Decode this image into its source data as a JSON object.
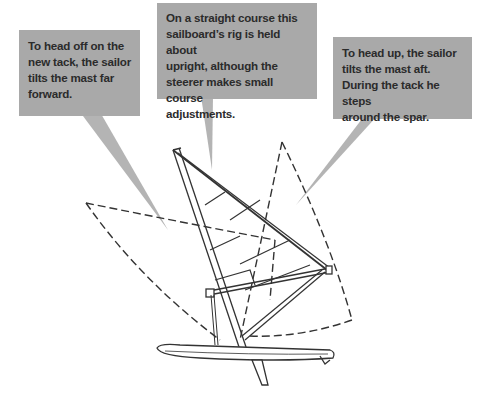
{
  "diagram": {
    "callouts": {
      "left": {
        "text": "To head off on the new tack, the sailor tilts the mast far forward.",
        "lines": [
          "To head off on the",
          "new tack, the sailor",
          "tilts the mast far",
          "forward."
        ]
      },
      "middle": {
        "text": "On a straight course this sailboard's rig is held about upright, although the steerer makes small course adjustments.",
        "lines": [
          "On a straight course this",
          "sailboard’s rig is held about",
          "upright, although the",
          "steerer makes small course",
          "adjustments."
        ]
      },
      "right": {
        "text": "To head up, the sailor tilts the mast aft. During the tack he steps around the spar.",
        "lines": [
          "To head up, the sailor",
          "tilts the mast aft.",
          "During the tack he steps",
          "around the spar."
        ]
      }
    },
    "colors": {
      "callout_bg": "#a9a9a9",
      "callout_text": "#2b2b2b",
      "pointer": "#b4b4b4",
      "line_art": "#333333",
      "background": "#ffffff"
    },
    "elements": [
      "sail (upright, solid)",
      "sail (tilted forward, dashed)",
      "sail (tilted aft, dashed)",
      "mast",
      "boom/wishbone",
      "board",
      "fin",
      "uphaul line"
    ]
  }
}
